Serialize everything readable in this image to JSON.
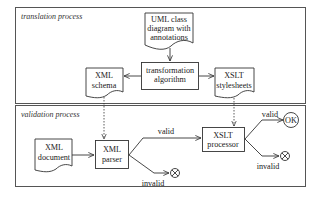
{
  "frames": {
    "translation": {
      "label": "translation process"
    },
    "validation": {
      "label": "validation process"
    }
  },
  "nodes": {
    "uml": {
      "lines": [
        "UML class",
        "diagram with",
        "annotations"
      ],
      "shape": "document"
    },
    "transform": {
      "lines": [
        "transformation",
        "algorithm"
      ],
      "shape": "process"
    },
    "xml_schema": {
      "lines": [
        "XML",
        "schema"
      ],
      "shape": "document"
    },
    "xslt_sheets": {
      "lines": [
        "XSLT",
        "stylesheets"
      ],
      "shape": "document"
    },
    "xml_doc": {
      "lines": [
        "XML",
        "document"
      ],
      "shape": "document"
    },
    "xml_parser": {
      "lines": [
        "XML",
        "parser"
      ],
      "shape": "process"
    },
    "xslt_proc": {
      "lines": [
        "XSLT",
        "processor"
      ],
      "shape": "process"
    },
    "ok": {
      "label": "OK",
      "shape": "terminal"
    }
  },
  "edges": {
    "parser_valid": "valid",
    "parser_invalid": "invalid",
    "proc_valid": "valid",
    "proc_invalid": "invalid"
  },
  "colors": {
    "line": "#333333",
    "frame": "#555555",
    "text": "#222222"
  }
}
